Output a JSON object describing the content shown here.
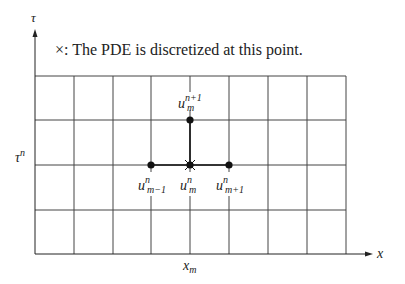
{
  "diagram": {
    "legend": {
      "symbol": "×",
      "text": ": The PDE is discretized at this point."
    },
    "axes": {
      "vertical": {
        "label": "τ"
      },
      "horizontal": {
        "label": "x"
      }
    },
    "tick_labels": {
      "tau_n": {
        "base": "τ",
        "sup": "n"
      },
      "x_m": {
        "base": "x",
        "sub": "m"
      }
    },
    "grid": {
      "columns": 8,
      "rows": 4,
      "x_lines": [
        35,
        74,
        113,
        151,
        190,
        229,
        268,
        307,
        346
      ],
      "y_lines": [
        76,
        120,
        165,
        210,
        254
      ]
    },
    "nodes": [
      {
        "id": "u_m_n1",
        "base": "u",
        "sub": "m",
        "sup": "n+1",
        "x": 190,
        "y": 120
      },
      {
        "id": "u_m-1_n",
        "base": "u",
        "sub": "m−1",
        "sup": "n",
        "x": 151,
        "y": 165
      },
      {
        "id": "u_m_n",
        "base": "u",
        "sub": "m",
        "sup": "n",
        "x": 190,
        "y": 165,
        "discretization_point": true
      },
      {
        "id": "u_m+1_n",
        "base": "u",
        "sub": "m+1",
        "sup": "n",
        "x": 229,
        "y": 165
      }
    ],
    "colors": {
      "grid": "#444444",
      "stencil": "#111111",
      "text": "#222222",
      "background": "#ffffff"
    }
  }
}
